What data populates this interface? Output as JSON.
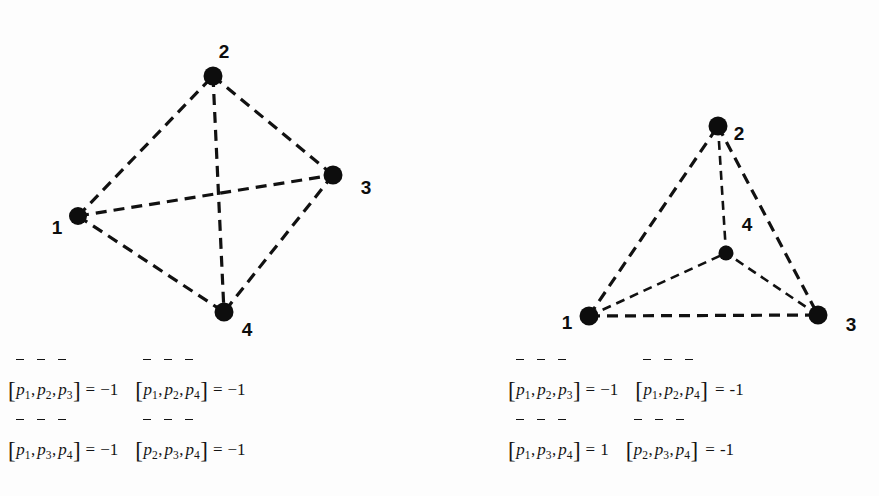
{
  "figure": {
    "caption_present": false,
    "background_color": "#fdfdfd",
    "ink_color": "#0d0d0d",
    "panels": [
      {
        "id": "left",
        "name": "convex-position-configuration",
        "description": "Four points in convex position; all six segments drawn dashed",
        "vertices": [
          {
            "id": 1,
            "label": "1",
            "x": 78,
            "y": 216,
            "r": 9,
            "label_x": 57,
            "label_y": 234
          },
          {
            "id": 2,
            "label": "2",
            "x": 213,
            "y": 76,
            "r": 9.5,
            "label_x": 224,
            "label_y": 58
          },
          {
            "id": 3,
            "label": "3",
            "x": 333,
            "y": 175,
            "r": 9.5,
            "label_x": 366,
            "label_y": 194
          },
          {
            "id": 4,
            "label": "4",
            "x": 224,
            "y": 312,
            "r": 9.5,
            "label_x": 247,
            "label_y": 336
          }
        ],
        "edges": [
          {
            "from": 1,
            "to": 2,
            "style": "dashed"
          },
          {
            "from": 2,
            "to": 3,
            "style": "dashed"
          },
          {
            "from": 1,
            "to": 4,
            "style": "dashed"
          },
          {
            "from": 3,
            "to": 4,
            "style": "dashed"
          },
          {
            "from": 1,
            "to": 3,
            "style": "dashed"
          },
          {
            "from": 2,
            "to": 4,
            "style": "dashed"
          }
        ]
      },
      {
        "id": "right",
        "name": "interior-point-configuration",
        "description": "Point 4 lies inside triangle 1-2-3; all six segments drawn dashed",
        "vertices": [
          {
            "id": 1,
            "label": "1",
            "x": 150,
            "y": 316,
            "r": 9.5,
            "label_x": 128,
            "label_y": 329
          },
          {
            "id": 2,
            "label": "2",
            "x": 279,
            "y": 126,
            "r": 9.5,
            "label_x": 300,
            "label_y": 140
          },
          {
            "id": 3,
            "label": "3",
            "x": 379,
            "y": 315,
            "r": 9.5,
            "label_x": 412,
            "label_y": 331
          },
          {
            "id": 4,
            "label": "4",
            "x": 287,
            "y": 253,
            "r": 7.5,
            "label_x": 308,
            "label_y": 231
          }
        ],
        "edges": [
          {
            "from": 1,
            "to": 2,
            "style": "dashed"
          },
          {
            "from": 2,
            "to": 3,
            "style": "dashed"
          },
          {
            "from": 1,
            "to": 3,
            "style": "dashed"
          },
          {
            "from": 2,
            "to": 4,
            "style": "dashed"
          },
          {
            "from": 1,
            "to": 4,
            "style": "dashed"
          },
          {
            "from": 3,
            "to": 4,
            "style": "dashed"
          }
        ]
      }
    ]
  },
  "equations": {
    "left": {
      "name": "chirotope-left",
      "rows": [
        [
          {
            "bracket_open": "[",
            "terms": [
              "1",
              "2",
              "3"
            ],
            "bracket_close": "]",
            "equals": "=",
            "value": "−1"
          },
          {
            "bracket_open": "[",
            "terms": [
              "1",
              "2",
              "4"
            ],
            "bracket_close": "]",
            "equals": "=",
            "value": "−1"
          }
        ],
        [
          {
            "bracket_open": "[",
            "terms": [
              "1",
              "3",
              "4"
            ],
            "bracket_close": "]",
            "equals": "=",
            "value": "−1"
          },
          {
            "bracket_open": "[",
            "terms": [
              "2",
              "3",
              "4"
            ],
            "bracket_close": "]",
            "equals": "=",
            "value": "−1"
          }
        ]
      ]
    },
    "right": {
      "name": "chirotope-right",
      "rows": [
        [
          {
            "bracket_open": "[",
            "terms": [
              "1",
              "2",
              "3"
            ],
            "bracket_close": "]",
            "equals": "=",
            "value": "−1"
          },
          {
            "bracket_open": "[",
            "terms": [
              "1",
              "2",
              "4"
            ],
            "bracket_close": "]",
            "equals": "=",
            "value": "-1"
          }
        ],
        [
          {
            "bracket_open": "[",
            "terms": [
              "1",
              "3",
              "4"
            ],
            "bracket_close": "]",
            "equals": "=",
            "value": "1"
          },
          {
            "bracket_open": "[",
            "terms": [
              "2",
              "3",
              "4"
            ],
            "bracket_close": "]",
            "equals": "=",
            "value": "-1"
          }
        ]
      ]
    },
    "symbol": {
      "base": "p",
      "accent": "bar"
    }
  }
}
